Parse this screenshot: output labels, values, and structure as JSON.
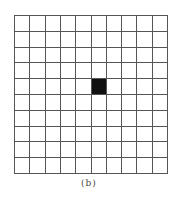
{
  "figure": {
    "caption": "(b)",
    "grid": {
      "rows": 10,
      "cols": 10,
      "line_color": "#555555",
      "cell_color": "#ffffff",
      "filled_color": "#111111",
      "filled_cells": [
        {
          "row": 4,
          "col": 5
        }
      ]
    }
  }
}
